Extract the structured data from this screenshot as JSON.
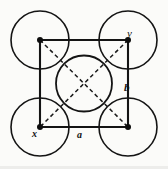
{
  "figure": {
    "background_color": "#fbfbf9",
    "stroke_color": "#141414",
    "labels": {
      "top_right_vertex": "y",
      "bottom_left_vertex": "x",
      "right_edge": "b",
      "bottom_edge": "a"
    },
    "geometry": {
      "square": {
        "left": 40,
        "top": 40,
        "right": 128,
        "bottom": 127,
        "side_px": 88,
        "stroke_width": 2.1,
        "style": "solid"
      },
      "vertices": [
        {
          "name": "top-left",
          "x": 40,
          "y": 40,
          "dot_radius": 3.0
        },
        {
          "name": "top-right",
          "x": 128,
          "y": 40,
          "dot_radius": 3.0
        },
        {
          "name": "bottom-left",
          "x": 40,
          "y": 127,
          "dot_radius": 3.0
        },
        {
          "name": "bottom-right",
          "x": 128,
          "y": 127,
          "dot_radius": 3.0
        }
      ],
      "corner_circles": [
        {
          "name": "circle-top-left",
          "cx": 40,
          "cy": 40,
          "r": 29
        },
        {
          "name": "circle-top-right",
          "cx": 128,
          "cy": 40,
          "r": 29
        },
        {
          "name": "circle-bottom-left",
          "cx": 40,
          "cy": 127,
          "r": 29
        },
        {
          "name": "circle-bottom-right",
          "cx": 128,
          "cy": 127,
          "r": 29
        }
      ],
      "center_circle": {
        "name": "circle-center",
        "cx": 84,
        "cy": 83.5,
        "r": 28
      },
      "diagonals": [
        {
          "name": "diagonal-tl-br",
          "x1": 40,
          "y1": 40,
          "x2": 128,
          "y2": 127
        },
        {
          "name": "diagonal-tr-bl",
          "x1": 128,
          "y1": 40,
          "x2": 40,
          "y2": 127
        }
      ],
      "diagonal_style": {
        "dash": "4 3",
        "stroke_width": 1.5
      },
      "circle_stroke_width": 1.6
    },
    "label_positions": {
      "y": {
        "left": 127,
        "top": 28
      },
      "b": {
        "left": 124,
        "top": 82
      },
      "x": {
        "left": 32,
        "top": 129
      },
      "a": {
        "left": 77,
        "top": 130
      }
    }
  }
}
